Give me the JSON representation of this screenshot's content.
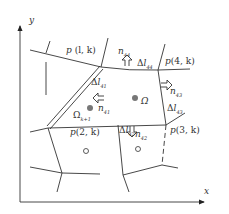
{
  "axes": {
    "x_label": "x",
    "y_label": "y"
  },
  "cells": {
    "p_lk": {
      "p": "p",
      "args": "(l, k)"
    },
    "p_4k": {
      "p": "p",
      "args": "(4,  k)"
    },
    "p_2k": {
      "p": "p",
      "args": "(2,  k)"
    },
    "p_3k": {
      "p": "p",
      "args": "(3,  k)"
    }
  },
  "normals": {
    "n44": {
      "n": "n",
      "sub": "44"
    },
    "n43": {
      "n": "n",
      "sub": "43"
    },
    "n41": {
      "n": "n",
      "sub": "41"
    },
    "n42": {
      "n": "n",
      "sub": "42"
    }
  },
  "edges": {
    "dl44": {
      "d": "Δ",
      "l": "l",
      "sub": "44"
    },
    "dl41": {
      "d": "Δ",
      "l": "l",
      "sub": "41"
    },
    "dl42": {
      "d": "Δ",
      "l": "l",
      "sub": "42"
    },
    "dl43": {
      "d": "Δ",
      "l": "l",
      "sub": "43"
    }
  },
  "domains": {
    "omega": {
      "sym": "Ω"
    },
    "omega_k1": {
      "sym": "Ω",
      "sub": "k+1"
    }
  },
  "colors": {
    "line": "#333333",
    "point_fill": "#777777"
  }
}
